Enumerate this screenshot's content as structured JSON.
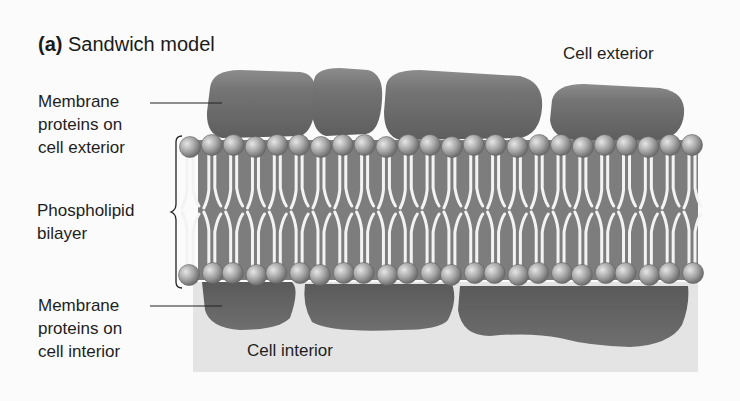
{
  "figure": {
    "panel_letter": "(a)",
    "title": "Sandwich model",
    "labels": {
      "cell_exterior": "Cell exterior",
      "cell_interior": "Cell interior",
      "ext_proteins_line1": "Membrane",
      "ext_proteins_line2": "proteins on",
      "ext_proteins_line3": "cell exterior",
      "bilayer_line1": "Phospholipid",
      "bilayer_line2": "bilayer",
      "int_proteins_line1": "Membrane",
      "int_proteins_line2": "proteins on",
      "int_proteins_line3": "cell interior"
    },
    "colors": {
      "protein": "#6e6e6e",
      "protein_highlight": "#8a8a8a",
      "head": "#a9a9a9",
      "tail": "#f2f2f2",
      "interior": "#e4e4e4"
    }
  }
}
